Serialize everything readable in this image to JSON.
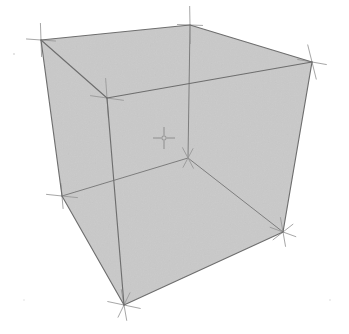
{
  "scene": {
    "title": "3D Perspective Cube Wireframe",
    "type": "wireframe-cube",
    "background_color": "#ffffff",
    "face_fill_color": "#c9c9c9",
    "face_fill_opacity": 1,
    "edge_color": "#6e6e6e",
    "hidden_edge_color": "#7a7a7a",
    "marker_color": "#8a8a8a",
    "edge_width": 1.1,
    "marker_width": 0.9,
    "canvas": {
      "width": 349,
      "height": 334
    }
  },
  "vertices": {
    "top_back_left": {
      "name": "top-back-left",
      "x": 41,
      "y": 40
    },
    "top_back_right": {
      "name": "top-back-right",
      "x": 190,
      "y": 25
    },
    "top_front_right": {
      "name": "top-front-right",
      "x": 312,
      "y": 62
    },
    "top_front_left": {
      "name": "top-front-left",
      "x": 107,
      "y": 98
    },
    "bottom_back_left": {
      "name": "bottom-back-left",
      "x": 62,
      "y": 196
    },
    "bottom_back_right": {
      "name": "bottom-back-right",
      "x": 188,
      "y": 158
    },
    "bottom_front_right": {
      "name": "bottom-front-right",
      "x": 283,
      "y": 232
    },
    "bottom_front_left": {
      "name": "bottom-front-left",
      "x": 124,
      "y": 305
    },
    "center_marker": {
      "name": "center-marker",
      "x": 164,
      "y": 138
    }
  },
  "faces": {
    "silhouette_points": "41,40 190,25 312,62 283,232 124,305 62,196",
    "note": "outer silhouette of the perspective cube, filled flat gray"
  },
  "edges": [
    {
      "name": "edge-top-back-left--top-back-right",
      "from": "top_back_left",
      "to": "top_back_right",
      "hidden": false
    },
    {
      "name": "edge-top-back-right--top-front-right",
      "from": "top_back_right",
      "to": "top_front_right",
      "hidden": false
    },
    {
      "name": "edge-top-front-right--top-front-left",
      "from": "top_front_right",
      "to": "top_front_left",
      "hidden": false
    },
    {
      "name": "edge-top-front-left--top-back-left",
      "from": "top_front_left",
      "to": "top_back_left",
      "hidden": false
    },
    {
      "name": "edge-top-back-left--bottom-back-left",
      "from": "top_back_left",
      "to": "bottom_back_left",
      "hidden": false
    },
    {
      "name": "edge-top-back-right--bottom-back-right",
      "from": "top_back_right",
      "to": "bottom_back_right",
      "hidden": true
    },
    {
      "name": "edge-top-front-right--bottom-front-right",
      "from": "top_front_right",
      "to": "bottom_front_right",
      "hidden": false
    },
    {
      "name": "edge-top-front-left--bottom-front-left",
      "from": "top_front_left",
      "to": "bottom_front_left",
      "hidden": false
    },
    {
      "name": "edge-bottom-back-left--bottom-back-right",
      "from": "bottom_back_left",
      "to": "bottom_back_right",
      "hidden": true
    },
    {
      "name": "edge-bottom-back-right--bottom-front-right",
      "from": "bottom_back_right",
      "to": "bottom_front_right",
      "hidden": true
    },
    {
      "name": "edge-bottom-front-right--bottom-front-left",
      "from": "bottom_front_right",
      "to": "bottom_front_left",
      "hidden": false
    },
    {
      "name": "edge-bottom-front-left--bottom-back-left",
      "from": "bottom_front_left",
      "to": "bottom_back_left",
      "hidden": false
    }
  ],
  "markers": [
    {
      "name": "vertex-marker-top-back-left",
      "x": 41,
      "y": 40,
      "arms": [
        {
          "angle": 92,
          "len": 34
        },
        {
          "angle": 176,
          "len": 30
        }
      ]
    },
    {
      "name": "vertex-marker-top-back-right",
      "x": 190,
      "y": 25,
      "arms": [
        {
          "angle": 91,
          "len": 38
        },
        {
          "angle": 178,
          "len": 26
        }
      ]
    },
    {
      "name": "vertex-marker-top-front-right",
      "x": 312,
      "y": 62,
      "arms": [
        {
          "angle": 104,
          "len": 36
        },
        {
          "angle": 170,
          "len": 30
        }
      ]
    },
    {
      "name": "vertex-marker-top-front-left",
      "x": 107,
      "y": 98,
      "arms": [
        {
          "angle": 94,
          "len": 40
        },
        {
          "angle": 172,
          "len": 34
        }
      ]
    },
    {
      "name": "vertex-marker-bottom-back-left",
      "x": 62,
      "y": 196,
      "arms": [
        {
          "angle": 95,
          "len": 26
        },
        {
          "angle": 174,
          "len": 32
        }
      ]
    },
    {
      "name": "vertex-marker-bottom-back-right",
      "x": 188,
      "y": 158,
      "arms": [
        {
          "angle": 118,
          "len": 24
        },
        {
          "angle": 62,
          "len": 22
        }
      ]
    },
    {
      "name": "vertex-marker-bottom-front-right",
      "x": 283,
      "y": 232,
      "arms": [
        {
          "angle": 100,
          "len": 30
        },
        {
          "angle": 160,
          "len": 28
        },
        {
          "angle": 38,
          "len": 26
        }
      ]
    },
    {
      "name": "vertex-marker-bottom-front-left",
      "x": 124,
      "y": 305,
      "arms": [
        {
          "angle": 100,
          "len": 32
        },
        {
          "angle": 168,
          "len": 34
        },
        {
          "angle": 64,
          "len": 28
        }
      ]
    }
  ],
  "center_cross": {
    "name": "center-cross-marker",
    "x": 164,
    "y": 138,
    "arm_length": 11,
    "inner_gap": 3,
    "hub_radius": 2.2
  }
}
